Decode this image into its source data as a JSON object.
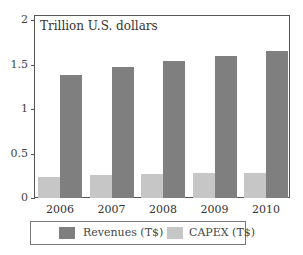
{
  "chart_data": {
    "type": "bar",
    "title": "",
    "unit_label": "Trillion U.S. dollars",
    "xlabel": "",
    "ylabel": "Trillion U.S. dollars",
    "categories": [
      "2006",
      "2007",
      "2008",
      "2009",
      "2010"
    ],
    "series": [
      {
        "name": "CAPEX (T$)",
        "color": "#c6c6c6",
        "values": [
          0.24,
          0.26,
          0.27,
          0.28,
          0.28
        ]
      },
      {
        "name": "Revenues (T$)",
        "color": "#7f7f7f",
        "values": [
          1.38,
          1.47,
          1.54,
          1.6,
          1.65
        ]
      }
    ],
    "ylim": [
      0,
      2
    ],
    "yticks": [
      "0",
      "0.5",
      "1",
      "1.5",
      "2"
    ],
    "grid": false,
    "legend_position": "bottom",
    "legend": [
      "Revenues (T$)",
      "CAPEX (T$)"
    ]
  }
}
